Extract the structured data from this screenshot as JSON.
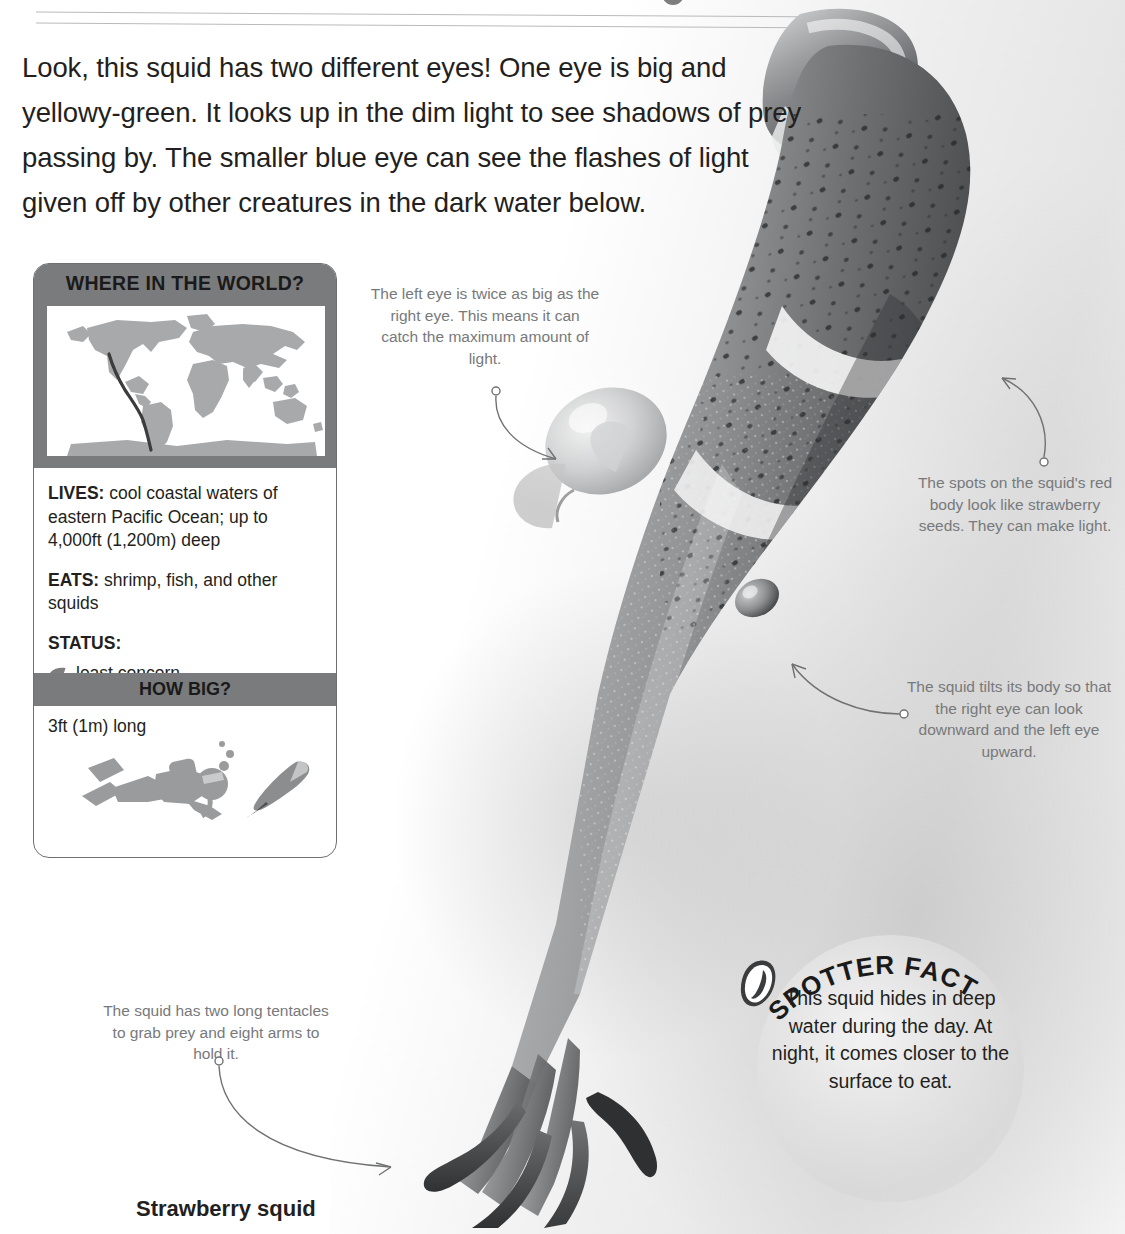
{
  "page": {
    "intro": "Look, this squid has two different eyes! One eye is big and yellowy-green. It looks up in the dim light to see shadows of prey passing by. The smaller blue eye can see the flashes of light given off by other creatures in the dark water below.",
    "caption": "Strawberry squid"
  },
  "card": {
    "header_title": "WHERE IN THE WORLD?",
    "lives_label": "LIVES:",
    "lives_value": "cool coastal waters of eastern Pacific Ocean; up to 4,000ft (1,200m) deep",
    "eats_label": "EATS:",
    "eats_value": "shrimp, fish, and other squids",
    "status_label": "STATUS:",
    "status_value": "least concern",
    "status_icon": "leaf-icon",
    "howbig_title": "HOW BIG?",
    "size_value": "3ft (1m) long",
    "scale_icons": [
      "scuba-diver-icon",
      "squid-silhouette-icon"
    ]
  },
  "callouts": {
    "eye": "The left eye is twice as big as the right eye. This means it can catch the maximum amount of light.",
    "spots": "The spots on the squid's red body look like strawberry seeds. They can make light.",
    "tilt": "The squid tilts its body so that the right eye can look downward and the left eye upward.",
    "tentacles": "The squid has two long tentacles to grab prey and eight arms to hold it."
  },
  "spotter": {
    "badge_label": "SPOTTER FACT",
    "text": "This squid hides in deep water during the day. At night, it comes closer to the surface to eat."
  },
  "colors": {
    "band_gray": "#7a7b7d",
    "text_dark": "#231f20",
    "callout_gray": "#77797b",
    "leader_gray": "#6f7173",
    "map_land": "#a8a9ab",
    "map_highlight": "#3c3c3c"
  }
}
